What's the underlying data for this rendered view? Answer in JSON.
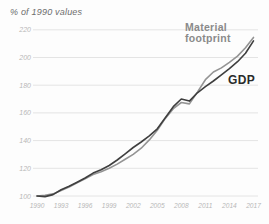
{
  "header": {
    "unit_label": "% of 1990 values"
  },
  "colors": {
    "material_footprint_line": "#949494",
    "gdp_line": "#3f3f3f",
    "material_footprint_label": "#8a8a8a",
    "gdp_label": "#2b2b2b",
    "gridline": "#e4e4e4",
    "tick_text": "#b8b8b8",
    "background": "#fdfdfd"
  },
  "chart_data": {
    "type": "line",
    "title": "",
    "ylabel": "% of 1990 values",
    "xlabel": "",
    "ylim": [
      100,
      220
    ],
    "xlim": [
      1990,
      2017
    ],
    "yticks": [
      100,
      120,
      140,
      160,
      180,
      200,
      220
    ],
    "xticks": [
      1990,
      1993,
      1996,
      1999,
      2002,
      2005,
      2008,
      2011,
      2014,
      2017
    ],
    "grid": "horizontal-only",
    "legend_position": "inline-end-labels",
    "x": [
      1990,
      1991,
      1992,
      1993,
      1994,
      1995,
      1996,
      1997,
      1998,
      1999,
      2000,
      2001,
      2002,
      2003,
      2004,
      2005,
      2006,
      2007,
      2008,
      2009,
      2010,
      2011,
      2012,
      2013,
      2014,
      2015,
      2016,
      2017
    ],
    "series": [
      {
        "name": "Material footprint",
        "values": [
          100,
          100.5,
          101.5,
          104,
          106.5,
          109.5,
          112.5,
          115.5,
          117.5,
          120,
          123,
          126.5,
          130,
          134.5,
          140.5,
          147.5,
          156,
          163,
          167.5,
          166.5,
          175,
          184,
          189.5,
          192.5,
          196.5,
          201,
          207,
          214.5
        ]
      },
      {
        "name": "GDP",
        "values": [
          100,
          99.6,
          101,
          104.5,
          107,
          110,
          113,
          116.5,
          119,
          122,
          126,
          130.5,
          135,
          139,
          143.5,
          148.5,
          156.5,
          164.5,
          170,
          168.5,
          174.5,
          179,
          183,
          187.5,
          192,
          197,
          203,
          212
        ]
      }
    ]
  }
}
